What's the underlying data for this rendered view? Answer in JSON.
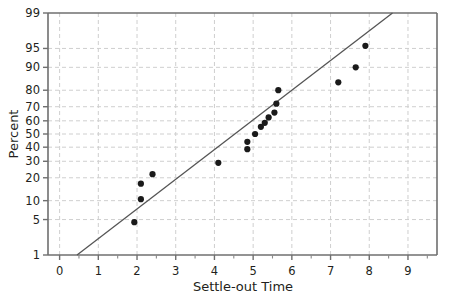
{
  "chart_data": {
    "type": "scatter",
    "title": "",
    "subtitle": "",
    "xlabel": "Settle-out Time",
    "ylabel": "Percent",
    "xlim": [
      -0.3,
      9.75
    ],
    "ylim": [
      1,
      99
    ],
    "yscale": "normal-probability",
    "grid": true,
    "legend": "none",
    "xticks": [
      0,
      1,
      2,
      3,
      4,
      5,
      6,
      7,
      8,
      9
    ],
    "xtick_labels": [
      "0",
      "1",
      "2",
      "3",
      "4",
      "5",
      "6",
      "7",
      "8",
      "9"
    ],
    "xminor_ticks": [
      0.5,
      1.5,
      2.5,
      3.5,
      4.5,
      5.5,
      6.5,
      7.5,
      8.5,
      9.5
    ],
    "yticks": [
      1,
      5,
      10,
      20,
      30,
      40,
      50,
      60,
      70,
      80,
      90,
      95,
      99
    ],
    "ytick_labels": [
      "1",
      "5",
      "10",
      "20",
      "30",
      "40",
      "50",
      "60",
      "70",
      "80",
      "90",
      "95",
      "99"
    ],
    "series": [
      {
        "name": "Settle-out time data",
        "marker": "filled-circle",
        "color": "#1a1a1a",
        "points": [
          {
            "x": 1.93,
            "y": 4.5
          },
          {
            "x": 2.1,
            "y": 10.5
          },
          {
            "x": 2.1,
            "y": 17.0
          },
          {
            "x": 2.4,
            "y": 22.0
          },
          {
            "x": 4.1,
            "y": 29.0
          },
          {
            "x": 4.85,
            "y": 38.5
          },
          {
            "x": 4.85,
            "y": 44.0
          },
          {
            "x": 5.05,
            "y": 50.0
          },
          {
            "x": 5.2,
            "y": 55.5
          },
          {
            "x": 5.3,
            "y": 58.5
          },
          {
            "x": 5.4,
            "y": 62.5
          },
          {
            "x": 5.55,
            "y": 66.0
          },
          {
            "x": 5.6,
            "y": 72.0
          },
          {
            "x": 5.65,
            "y": 80.0
          },
          {
            "x": 7.2,
            "y": 84.0
          },
          {
            "x": 7.65,
            "y": 90.0
          },
          {
            "x": 7.9,
            "y": 95.5
          }
        ]
      }
    ],
    "reference_line": {
      "name": "fitted normal line",
      "color": "#555555",
      "x_start": 0.45,
      "y_start": 1,
      "x_end": 8.6,
      "y_end": 99
    }
  }
}
